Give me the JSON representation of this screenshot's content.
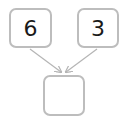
{
  "diagram": {
    "type": "number-bond",
    "parts": [
      {
        "id": "left",
        "value": "6"
      },
      {
        "id": "right",
        "value": "3"
      }
    ],
    "whole": {
      "id": "bottom",
      "value": ""
    },
    "colors": {
      "border": "#bdbdbd",
      "arrow": "#b5b5b5",
      "text": "#1a1a1a"
    }
  }
}
